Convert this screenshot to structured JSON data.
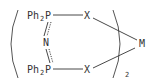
{
  "structure": {
    "atoms": {
      "top_p_group": "Ph",
      "top_p_sub": "2",
      "top_p_atom": "P",
      "top_x": "X",
      "nitrogen": "N",
      "bottom_p_group": "Ph",
      "bottom_p_sub": "2",
      "bottom_p_atom": "P",
      "bottom_x": "X",
      "metal": "M"
    },
    "multiplier": "2",
    "color": "#333333"
  }
}
